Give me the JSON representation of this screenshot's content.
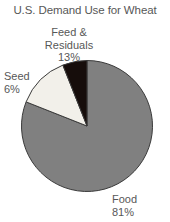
{
  "chart_data": {
    "type": "pie",
    "title": "U.S. Demand Use for Wheat",
    "xlabel": "",
    "ylabel": "",
    "categories": [
      "Food",
      "Feed & Residuals",
      "Seed"
    ],
    "values": [
      81,
      13,
      6
    ],
    "value_labels": [
      "81%",
      "13%",
      "6%"
    ],
    "unit": "%",
    "legend": "none",
    "grid": false,
    "start_angle_deg": 0,
    "direction": "clockwise",
    "slices": [
      {
        "name": "Food",
        "label_line1": "Food",
        "label_line2": "81%",
        "value": 81,
        "color": "#808080",
        "edge_color": "#3a3a3a",
        "start_deg": 0,
        "sweep_deg": 291.6,
        "label_position": "bottom-right"
      },
      {
        "name": "Feed & Residuals",
        "label_line1": "Feed &",
        "label_line2": "Residuals",
        "label_line3": "13%",
        "value": 13,
        "color": "#f2f0ea",
        "edge_color": "#3a3a3a",
        "start_deg": 291.6,
        "sweep_deg": 46.8,
        "label_position": "top"
      },
      {
        "name": "Seed",
        "label_line1": "Seed",
        "label_line2": "6%",
        "value": 6,
        "color": "#160d0b",
        "edge_color": "#3a3a3a",
        "start_deg": 338.4,
        "sweep_deg": 21.6,
        "label_position": "upper-left"
      }
    ]
  },
  "figure": {
    "background": "#ffffff",
    "text_color": "#575757"
  }
}
